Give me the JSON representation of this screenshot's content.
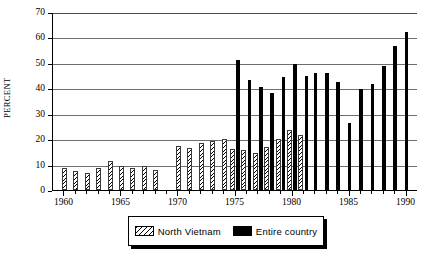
{
  "chart_data": {
    "type": "bar",
    "title": "",
    "subtitle": "",
    "xlabel": "",
    "ylabel": "PERCENT",
    "ylim": [
      0,
      70
    ],
    "ytick_step": 10,
    "yticks": [
      0,
      10,
      20,
      30,
      40,
      50,
      60,
      70
    ],
    "xlim": [
      1959,
      1991
    ],
    "xticks": [
      1960,
      1965,
      1970,
      1975,
      1980,
      1985,
      1990
    ],
    "xtick_labels": [
      "1960",
      "1965",
      "1970",
      "1975",
      "1980",
      "1985",
      "1990"
    ],
    "grid": "horizontal",
    "legend_position": "bottom-center",
    "categories": [
      1960,
      1961,
      1962,
      1963,
      1964,
      1965,
      1966,
      1967,
      1968,
      1969,
      1970,
      1971,
      1972,
      1973,
      1974,
      1975,
      1976,
      1977,
      1978,
      1979,
      1980,
      1981,
      1982,
      1983,
      1984,
      1985,
      1986,
      1987,
      1988,
      1989,
      1990
    ],
    "series": [
      {
        "name": "North Vietnam",
        "fill": "diagonal-hatch",
        "color": "#000000",
        "values": [
          8.7,
          7.3,
          6.7,
          8.6,
          11.3,
          9.3,
          8.5,
          9.4,
          8.0,
          null,
          17.4,
          16.5,
          18.6,
          19.3,
          20.2,
          16.1,
          15.8,
          14.7,
          17.0,
          19.9,
          23.5,
          21.6,
          null,
          null,
          null,
          null,
          null,
          null,
          null,
          null,
          null
        ]
      },
      {
        "name": "Entire country",
        "fill": "solid",
        "color": "#000000",
        "values": [
          null,
          null,
          null,
          null,
          null,
          null,
          null,
          null,
          null,
          null,
          null,
          null,
          null,
          null,
          null,
          51.3,
          43.1,
          40.5,
          38.3,
          44.6,
          49.7,
          44.7,
          46.2,
          46.0,
          42.4,
          26.2,
          39.8,
          41.6,
          48.6,
          56.7,
          62.3
        ]
      }
    ]
  },
  "legend": {
    "entries": [
      {
        "label": "North Vietnam",
        "swatch": "hatch-swatch"
      },
      {
        "label": "Entire country",
        "swatch": "solid-swatch"
      }
    ]
  },
  "axis": {
    "y_title": "PERCENT",
    "y_tick_labels": [
      "70",
      "60",
      "50",
      "40",
      "30",
      "20",
      "10",
      "0"
    ],
    "x_tick_labels": [
      "1960",
      "1965",
      "1970",
      "1975",
      "1980",
      "1985",
      "1990"
    ]
  }
}
